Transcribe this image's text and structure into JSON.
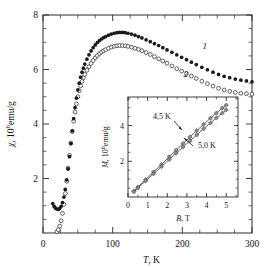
{
  "figure": {
    "title": "",
    "background_color": "#ffffff",
    "axis_color": "#2b2b2b"
  },
  "main_axes": {
    "xlabel_italic": "T",
    "xlabel_rest": ", K",
    "ylabel_italic": "χ",
    "ylabel_rest": ", 10",
    "ylabel_exp": "6",
    "ylabel_tail": "emu/g",
    "xticks": [
      "0",
      "100",
      "200",
      "300"
    ],
    "yticks": [
      "2",
      "4",
      "6",
      "8"
    ],
    "xlim": [
      0,
      300
    ],
    "ylim": [
      0,
      8
    ],
    "series_labels": [
      "1",
      "2"
    ]
  },
  "inset_axes": {
    "xlabel_italic": "B",
    "xlabel_rest": ", T",
    "ylabel_italic": "M",
    "ylabel_rest": ", 10",
    "ylabel_exp": "6",
    "ylabel_tail": "emu/g",
    "xticks": [
      "0",
      "1",
      "2",
      "3",
      "4",
      "5"
    ],
    "yticks": [
      "2",
      "4"
    ],
    "xlim": [
      0,
      5.6
    ],
    "ylim": [
      0,
      5.6
    ],
    "annotations": [
      "4,5 K",
      "5,0 K"
    ]
  },
  "chart_data": [
    {
      "type": "scatter",
      "id": "main",
      "title": "",
      "xlabel": "T, K",
      "ylabel": "χ, 10⁶ emu/g",
      "xlim": [
        0,
        300
      ],
      "ylim": [
        0,
        8
      ],
      "xticks": [
        0,
        100,
        200,
        300
      ],
      "yticks": [
        0,
        2,
        4,
        6,
        8
      ],
      "grid": false,
      "legend": "inline-curve-numbers",
      "series": [
        {
          "name": "1",
          "marker": "filled-circle",
          "color": "#1a1a1a",
          "x": [
            14,
            16,
            18,
            20,
            22,
            24,
            26,
            28,
            30,
            32,
            34,
            36,
            38,
            40,
            42,
            44,
            46,
            48,
            50,
            52,
            54,
            56,
            58,
            60,
            63,
            66,
            69,
            72,
            75,
            78,
            81,
            84,
            87,
            90,
            94,
            98,
            102,
            106,
            110,
            114,
            118,
            122,
            127,
            132,
            137,
            142,
            148,
            154,
            160,
            166,
            172,
            178,
            185,
            192,
            199,
            206,
            213,
            220,
            228,
            236,
            244,
            252,
            260,
            268,
            276,
            284,
            292,
            300
          ],
          "y": [
            1.08,
            0.98,
            0.91,
            0.88,
            0.87,
            0.9,
            0.98,
            1.12,
            1.32,
            1.6,
            1.95,
            2.35,
            2.8,
            3.28,
            3.75,
            4.2,
            4.6,
            4.95,
            5.25,
            5.5,
            5.72,
            5.9,
            6.05,
            6.2,
            6.38,
            6.54,
            6.68,
            6.8,
            6.9,
            6.99,
            7.06,
            7.12,
            7.17,
            7.21,
            7.26,
            7.3,
            7.33,
            7.35,
            7.36,
            7.36,
            7.35,
            7.33,
            7.3,
            7.26,
            7.21,
            7.16,
            7.09,
            7.02,
            6.95,
            6.88,
            6.8,
            6.72,
            6.63,
            6.54,
            6.45,
            6.36,
            6.27,
            6.18,
            6.08,
            5.99,
            5.9,
            5.82,
            5.75,
            5.7,
            5.65,
            5.61,
            5.58,
            5.55
          ]
        },
        {
          "name": "2",
          "marker": "open-circle",
          "color": "#3a3a3a",
          "x": [
            20,
            22,
            24,
            26,
            28,
            30,
            32,
            34,
            36,
            38,
            40,
            42,
            44,
            46,
            48,
            50,
            52,
            54,
            56,
            58,
            60,
            63,
            66,
            69,
            72,
            75,
            78,
            81,
            84,
            87,
            90,
            94,
            98,
            102,
            106,
            110,
            114,
            118,
            122,
            127,
            132,
            137,
            142,
            148,
            154,
            160,
            166,
            172,
            178,
            185,
            192,
            199,
            206,
            213,
            220,
            228,
            236,
            244,
            252,
            260,
            268,
            276,
            284,
            292,
            300
          ],
          "y": [
            0.05,
            0.12,
            0.25,
            0.45,
            0.72,
            1.05,
            1.45,
            1.9,
            2.38,
            2.85,
            3.3,
            3.72,
            4.1,
            4.44,
            4.74,
            5.0,
            5.22,
            5.4,
            5.56,
            5.7,
            5.82,
            5.97,
            6.1,
            6.22,
            6.33,
            6.43,
            6.51,
            6.58,
            6.64,
            6.69,
            6.73,
            6.78,
            6.82,
            6.85,
            6.87,
            6.88,
            6.88,
            6.87,
            6.85,
            6.82,
            6.78,
            6.74,
            6.69,
            6.62,
            6.55,
            6.47,
            6.39,
            6.31,
            6.23,
            6.13,
            6.03,
            5.94,
            5.85,
            5.76,
            5.67,
            5.57,
            5.48,
            5.39,
            5.31,
            5.25,
            5.2,
            5.16,
            5.13,
            5.11,
            5.1
          ]
        }
      ]
    },
    {
      "type": "line",
      "id": "inset",
      "title": "",
      "xlabel": "B, T",
      "ylabel": "M, 10⁶ emu/g",
      "xlim": [
        0,
        5.6
      ],
      "ylim": [
        0,
        5.6
      ],
      "xticks": [
        0,
        1,
        2,
        3,
        4,
        5
      ],
      "yticks": [
        2,
        4
      ],
      "grid": false,
      "series": [
        {
          "name": "4,5 K",
          "marker": "diamond",
          "color": "#3a3a3a",
          "x": [
            0.3,
            0.5,
            0.9,
            1.3,
            1.7,
            2.1,
            2.45,
            2.8,
            3.15,
            3.5,
            3.85,
            4.2,
            4.5,
            4.8,
            5.0
          ],
          "y": [
            0.33,
            0.55,
            0.98,
            1.4,
            1.82,
            2.25,
            2.62,
            2.99,
            3.36,
            3.72,
            4.07,
            4.42,
            4.7,
            4.98,
            5.15
          ]
        },
        {
          "name": "5,0 K",
          "marker": "diamond",
          "color": "#3a3a3a",
          "x": [
            0.3,
            0.5,
            0.9,
            1.3,
            1.7,
            2.1,
            2.45,
            2.8,
            3.15,
            3.5,
            3.85,
            4.2,
            4.5,
            4.8,
            5.0
          ],
          "y": [
            0.3,
            0.5,
            0.9,
            1.3,
            1.7,
            2.1,
            2.45,
            2.8,
            3.14,
            3.48,
            3.82,
            4.15,
            4.43,
            4.7,
            4.88
          ]
        }
      ]
    }
  ]
}
